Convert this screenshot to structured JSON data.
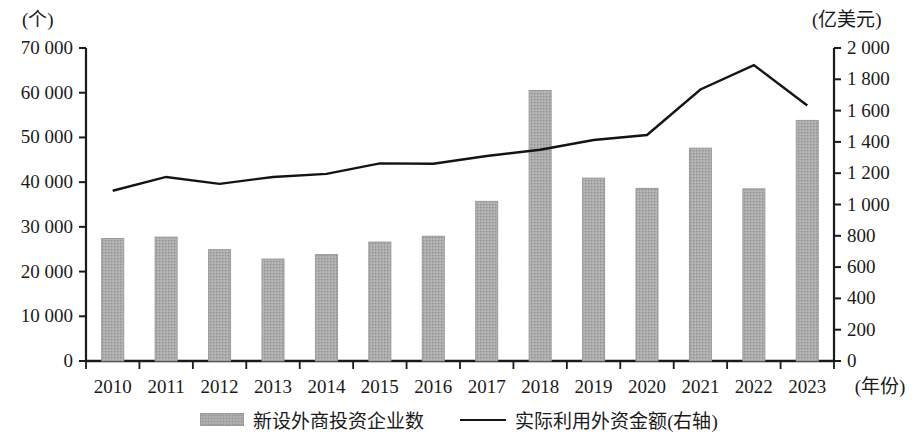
{
  "chart_data": {
    "type": "bar",
    "title": "",
    "xlabel": "(年份)",
    "categories": [
      "2010",
      "2011",
      "2012",
      "2013",
      "2014",
      "2015",
      "2016",
      "2017",
      "2018",
      "2019",
      "2020",
      "2021",
      "2022",
      "2023"
    ],
    "series": [
      {
        "name": "新设外商投资企业数",
        "type": "bar",
        "axis": "left",
        "unit": "个",
        "values": [
          27400,
          27700,
          24900,
          22800,
          23800,
          26600,
          27900,
          35700,
          60500,
          40900,
          38600,
          47600,
          38500,
          53800
        ]
      },
      {
        "name": "实际利用外资金额(右轴)",
        "type": "line",
        "axis": "right",
        "unit": "亿美元",
        "values": [
          1088,
          1176,
          1132,
          1176,
          1196,
          1263,
          1260,
          1310,
          1350,
          1412,
          1444,
          1735,
          1891,
          1633
        ]
      }
    ],
    "left_axis": {
      "unit_label": "(个)",
      "min": 0,
      "max": 70000,
      "step": 10000,
      "ticks": [
        "0",
        "10 000",
        "20 000",
        "30 000",
        "40 000",
        "50 000",
        "60 000",
        "70 000"
      ]
    },
    "right_axis": {
      "unit_label": "(亿美元)",
      "min": 0,
      "max": 2000,
      "step": 200,
      "ticks": [
        "0",
        "200",
        "400",
        "600",
        "800",
        "1 000",
        "1 200",
        "1 400",
        "1 600",
        "1 800",
        "2 000"
      ]
    },
    "grid": false,
    "legend_position": "bottom",
    "colors": {
      "bar_fill": "#a9a9a9",
      "bar_edge": "#9a9a9a",
      "line": "#141414",
      "axis": "#1a1a1a",
      "background": "#ffffff"
    }
  },
  "legend": {
    "bar_label": "新设外商投资企业数",
    "line_label": "实际利用外资金额(右轴)"
  }
}
